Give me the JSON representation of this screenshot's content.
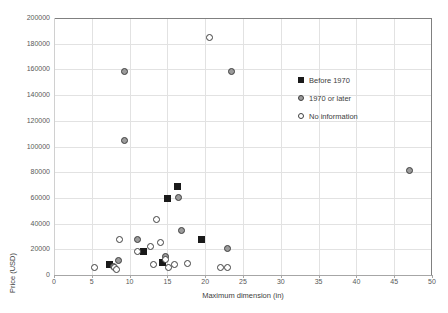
{
  "chart_data": {
    "type": "scatter",
    "title": "",
    "xlabel": "Maximum dimension (in)",
    "ylabel": "Price (USD)",
    "xlim": [
      0,
      50
    ],
    "ylim": [
      0,
      200000
    ],
    "xticks": [
      0,
      5,
      10,
      15,
      20,
      25,
      30,
      35,
      40,
      45,
      50
    ],
    "yticks": [
      0,
      20000,
      40000,
      60000,
      80000,
      100000,
      120000,
      140000,
      160000,
      180000,
      200000
    ],
    "xtick_labels": [
      "0",
      "5",
      "10",
      "15",
      "20",
      "25",
      "30",
      "35",
      "40",
      "45",
      "50"
    ],
    "ytick_labels": [
      "0",
      "20000",
      "40000",
      "60000",
      "80000",
      "100000",
      "120000",
      "140000",
      "160000",
      "180000",
      "200000"
    ],
    "grid": true,
    "legend_position": "upper-right-inside",
    "series": [
      {
        "name": "Before 1970",
        "marker": "square-filled",
        "color": "#1a1a1a",
        "points": [
          [
            7.4,
            8500
          ],
          [
            11.8,
            18500
          ],
          [
            14.3,
            9500
          ],
          [
            15.0,
            59500
          ],
          [
            16.3,
            69000
          ],
          [
            19.5,
            28000
          ]
        ]
      },
      {
        "name": "1970 or later",
        "marker": "circle-gray",
        "color": "#9b9b9b",
        "points": [
          [
            7.9,
            6500
          ],
          [
            8.5,
            11500
          ],
          [
            9.3,
            158000
          ],
          [
            9.3,
            104500
          ],
          [
            11.1,
            28000
          ],
          [
            14.8,
            14500
          ],
          [
            16.5,
            60000
          ],
          [
            16.8,
            34500
          ],
          [
            22.9,
            20500
          ],
          [
            23.5,
            158000
          ],
          [
            47.0,
            81000
          ]
        ]
      },
      {
        "name": "No information",
        "marker": "circle-open",
        "color": "#ffffff",
        "points": [
          [
            5.4,
            6000
          ],
          [
            8.0,
            5500
          ],
          [
            8.3,
            4500
          ],
          [
            8.6,
            28000
          ],
          [
            11.0,
            18000
          ],
          [
            12.8,
            22500
          ],
          [
            13.2,
            8000
          ],
          [
            13.5,
            43500
          ],
          [
            14.1,
            25000
          ],
          [
            14.8,
            12000
          ],
          [
            15.2,
            5500
          ],
          [
            15.9,
            8500
          ],
          [
            17.7,
            9000
          ],
          [
            20.6,
            185000
          ],
          [
            22.0,
            5500
          ],
          [
            23.0,
            5500
          ]
        ]
      }
    ]
  },
  "legend": {
    "items": [
      {
        "label": "Before 1970",
        "marker": "square-filled"
      },
      {
        "label": "1970 or later",
        "marker": "circle-gray"
      },
      {
        "label": "No information",
        "marker": "circle-open"
      }
    ]
  }
}
